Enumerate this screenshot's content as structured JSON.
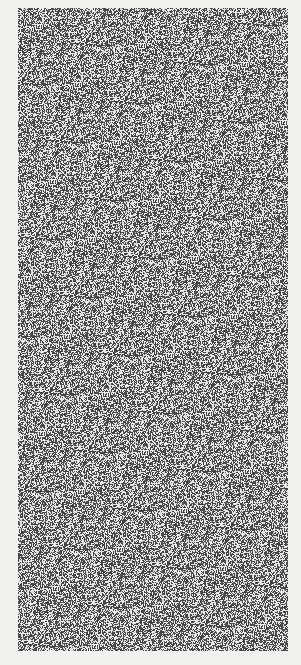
{
  "page": {
    "background": "#f1f1f0"
  },
  "noise_panel": {
    "description": "grayscale random-dot noise texture",
    "x": 18,
    "y": 8,
    "width": 270,
    "height": 643,
    "dark_color": "#4a4a4a",
    "light_color": "#e6e6e6",
    "light_ratio": 0.45
  }
}
